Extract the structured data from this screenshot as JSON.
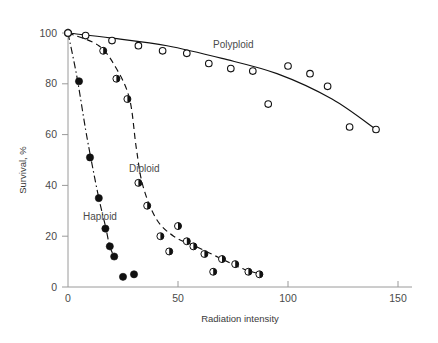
{
  "chart_data": {
    "type": "scatter",
    "title": "",
    "xlabel": "Radiation intensity",
    "ylabel": "Survival, %",
    "xlim": [
      0,
      150
    ],
    "ylim": [
      0,
      100
    ],
    "xticks": [
      0,
      50,
      100,
      150
    ],
    "yticks": [
      0,
      20,
      40,
      60,
      80,
      100
    ],
    "xtick_labels": [
      "0",
      "50",
      "100",
      "150"
    ],
    "ytick_labels": [
      "0",
      "20",
      "40",
      "60",
      "80",
      "100"
    ],
    "grid": false,
    "legend_position": "inline-annotations",
    "series": [
      {
        "name": "Haploid",
        "marker": "filled-circle",
        "line_style": "dash-dot",
        "annotation": "Haploid",
        "x": [
          0,
          5,
          10,
          14,
          17,
          19,
          21,
          25,
          30
        ],
        "y": [
          100,
          81,
          51,
          35,
          23,
          16,
          12,
          4,
          5
        ]
      },
      {
        "name": "Diploid",
        "marker": "half-filled-circle",
        "line_style": "dashed",
        "annotation": "Diploid",
        "x": [
          0,
          16,
          22,
          27,
          32,
          36,
          42,
          46,
          50,
          54,
          57,
          62,
          66,
          70,
          76,
          82,
          87
        ],
        "y": [
          100,
          93,
          82,
          74,
          41,
          32,
          20,
          14,
          24,
          18,
          16,
          13,
          6,
          11,
          9,
          6,
          5
        ]
      },
      {
        "name": "Polyploid",
        "marker": "open-circle",
        "line_style": "solid",
        "annotation": "Polyploid",
        "x": [
          0,
          8,
          20,
          32,
          43,
          54,
          64,
          74,
          84,
          91,
          100,
          110,
          118,
          128,
          140
        ],
        "y": [
          100,
          99,
          97,
          95,
          93,
          92,
          88,
          86,
          85,
          72,
          87,
          84,
          79,
          63,
          62
        ]
      }
    ]
  },
  "annotations": {
    "haploid_label": "Haploid",
    "diploid_label": "Diploid",
    "polyploid_label": "Polyploid"
  }
}
